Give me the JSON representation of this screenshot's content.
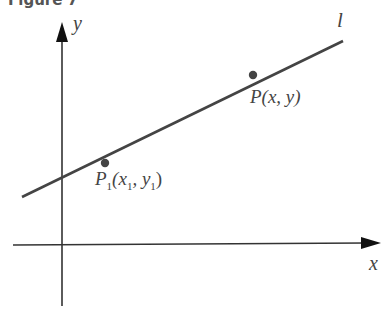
{
  "figure": {
    "caption": "Figure 7",
    "axes": {
      "x_label": "x",
      "y_label": "y"
    },
    "line": {
      "label": "l"
    },
    "points": [
      {
        "name": "P",
        "sub": "1",
        "coords_open": "(x",
        "x_sub": "1",
        "mid": ", y",
        "y_sub": "1",
        "close": ")"
      },
      {
        "label": "P(x, y)"
      }
    ],
    "colors": {
      "line": "#444444",
      "axes": "#333333",
      "point": "#444444"
    }
  }
}
